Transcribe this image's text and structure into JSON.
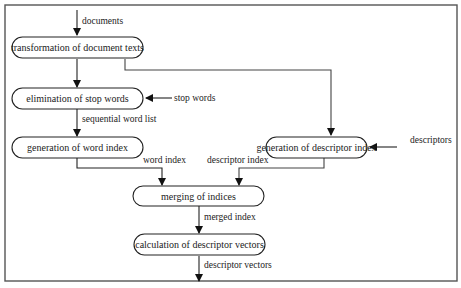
{
  "diagram": {
    "type": "flowchart",
    "nodes": {
      "transform": {
        "label": "transformation of document texts"
      },
      "stopwords": {
        "label": "elimination of stop words"
      },
      "wordindex": {
        "label": "generation of word index"
      },
      "descindex": {
        "label": "generation of descriptor index"
      },
      "merge": {
        "label": "merging of indices"
      },
      "vectors": {
        "label": "calculation of descriptor vectors"
      }
    },
    "edge_labels": {
      "documents": "documents",
      "stop_words": "stop words",
      "sequential_word_list": "sequential word list",
      "descriptors": "descriptors",
      "word_index": "word index",
      "descriptor_index": "descriptor index",
      "merged_index": "merged index",
      "descriptor_vectors": "descriptor vectors"
    },
    "edges": [
      {
        "from": "input",
        "to": "transform",
        "label": "documents"
      },
      {
        "from": "transform",
        "to": "stopwords",
        "label": ""
      },
      {
        "from": "transform",
        "to": "descindex",
        "label": ""
      },
      {
        "from": "input",
        "to": "stopwords",
        "label": "stop words"
      },
      {
        "from": "stopwords",
        "to": "wordindex",
        "label": "sequential word list"
      },
      {
        "from": "input",
        "to": "descindex",
        "label": "descriptors"
      },
      {
        "from": "wordindex",
        "to": "merge",
        "label": "word index"
      },
      {
        "from": "descindex",
        "to": "merge",
        "label": "descriptor index"
      },
      {
        "from": "merge",
        "to": "vectors",
        "label": "merged index"
      },
      {
        "from": "vectors",
        "to": "output",
        "label": "descriptor vectors"
      }
    ]
  }
}
